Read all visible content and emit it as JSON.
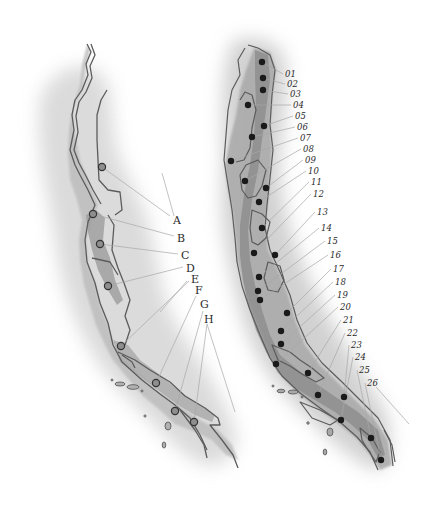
{
  "figure": {
    "width": 435,
    "height": 514,
    "colors": {
      "background": "#ffffff",
      "wash": "#c9c9c9",
      "land_light": "#b5b5b5",
      "land_mid": "#9a9a9a",
      "land_dark": "#7a7a7a",
      "outline": "#5c5c5c",
      "leader_line": "#a8a8a8",
      "left_marker_fill": "#8e8e8e",
      "left_marker_stroke": "#333333",
      "right_marker_fill": "#1a1a1a",
      "label_text": "#2a2a2a"
    }
  },
  "left_map": {
    "title": "Left coastline map (letter-labelled sites)",
    "sites": [
      {
        "label": "A",
        "dot": [
          102,
          167
        ],
        "text": [
          173,
          224
        ],
        "anchor": [
          170,
          216
        ]
      },
      {
        "label": "B",
        "dot": [
          93,
          214
        ],
        "text": [
          177,
          242
        ],
        "anchor": [
          174,
          236
        ]
      },
      {
        "label": "C",
        "dot": [
          100,
          244
        ],
        "text": [
          181,
          259
        ],
        "anchor": [
          178,
          254
        ]
      },
      {
        "label": "D",
        "dot": [
          108,
          286
        ],
        "text": [
          186,
          272
        ],
        "anchor": [
          183,
          267
        ]
      },
      {
        "label": "E",
        "dot": [
          121,
          346
        ],
        "text": [
          191,
          283
        ],
        "anchor": [
          189,
          281
        ]
      },
      {
        "label": "F",
        "dot": [
          156,
          383
        ],
        "text": [
          195,
          294
        ],
        "anchor": [
          196,
          296
        ]
      },
      {
        "label": "G",
        "dot": [
          175,
          411
        ],
        "text": [
          200,
          308
        ],
        "anchor": [
          203,
          311
        ]
      },
      {
        "label": "H",
        "dot": [
          194,
          422
        ],
        "text": [
          204,
          323
        ],
        "anchor": [
          207,
          324
        ]
      }
    ],
    "extra_leaders": [
      {
        "from": [
          162,
          173
        ],
        "to": [
          174,
          216
        ]
      },
      {
        "from": [
          207,
          324
        ],
        "to": [
          235,
          412
        ]
      },
      {
        "from": [
          187,
          281
        ],
        "to": [
          160,
          312
        ]
      }
    ]
  },
  "right_map": {
    "title": "Right coastline map (numbered sites)",
    "sites": [
      {
        "label": "01",
        "dot": [
          262,
          62
        ],
        "text": [
          285,
          77
        ]
      },
      {
        "label": "02",
        "dot": [
          263,
          78
        ],
        "text": [
          287,
          87
        ]
      },
      {
        "label": "03",
        "dot": [
          263,
          90
        ],
        "text": [
          290,
          97
        ]
      },
      {
        "label": "04",
        "dot": [
          248,
          105
        ],
        "text": [
          293,
          108
        ]
      },
      {
        "label": "05",
        "dot": [
          264,
          126
        ],
        "text": [
          295,
          119
        ]
      },
      {
        "label": "06",
        "dot": [
          252,
          137
        ],
        "text": [
          297,
          130
        ]
      },
      {
        "label": "07",
        "dot": [
          231,
          161
        ],
        "text": [
          300,
          141
        ]
      },
      {
        "label": "08",
        "dot": [
          245,
          181
        ],
        "text": [
          303,
          152
        ]
      },
      {
        "label": "09",
        "dot": [
          266,
          188
        ],
        "text": [
          305,
          163
        ]
      },
      {
        "label": "10",
        "dot": [
          259,
          202
        ],
        "text": [
          308,
          174
        ]
      },
      {
        "label": "11",
        "dot": [
          262,
          228
        ],
        "text": [
          311,
          185
        ]
      },
      {
        "label": "12",
        "dot": [
          254,
          253
        ],
        "text": [
          313,
          197
        ]
      },
      {
        "label": "13",
        "dot": [
          275,
          255
        ],
        "text": [
          317,
          215
        ]
      },
      {
        "label": "14",
        "dot": [
          259,
          277
        ],
        "text": [
          321,
          231
        ]
      },
      {
        "label": "15",
        "dot": [
          258,
          291
        ],
        "text": [
          327,
          244
        ]
      },
      {
        "label": "16",
        "dot": [
          260,
          300
        ],
        "text": [
          330,
          258
        ]
      },
      {
        "label": "17",
        "dot": [
          287,
          313
        ],
        "text": [
          333,
          272
        ]
      },
      {
        "label": "18",
        "dot": [
          281,
          331
        ],
        "text": [
          335,
          285
        ]
      },
      {
        "label": "19",
        "dot": [
          281,
          344
        ],
        "text": [
          337,
          298
        ]
      },
      {
        "label": "20",
        "dot": [
          276,
          364
        ],
        "text": [
          340,
          310
        ]
      },
      {
        "label": "21",
        "dot": [
          308,
          373
        ],
        "text": [
          343,
          323
        ]
      },
      {
        "label": "22",
        "dot": [
          318,
          395
        ],
        "text": [
          347,
          336
        ]
      },
      {
        "label": "23",
        "dot": [
          344,
          397
        ],
        "text": [
          351,
          348
        ]
      },
      {
        "label": "24",
        "dot": [
          341,
          420
        ],
        "text": [
          355,
          360
        ]
      },
      {
        "label": "25",
        "dot": [
          371,
          438
        ],
        "text": [
          359,
          373
        ]
      },
      {
        "label": "26",
        "dot": [
          381,
          460
        ],
        "text": [
          367,
          386
        ]
      }
    ],
    "extra_leaders": [
      {
        "from": [
          376,
          387
        ],
        "to": [
          409,
          424
        ]
      }
    ]
  }
}
